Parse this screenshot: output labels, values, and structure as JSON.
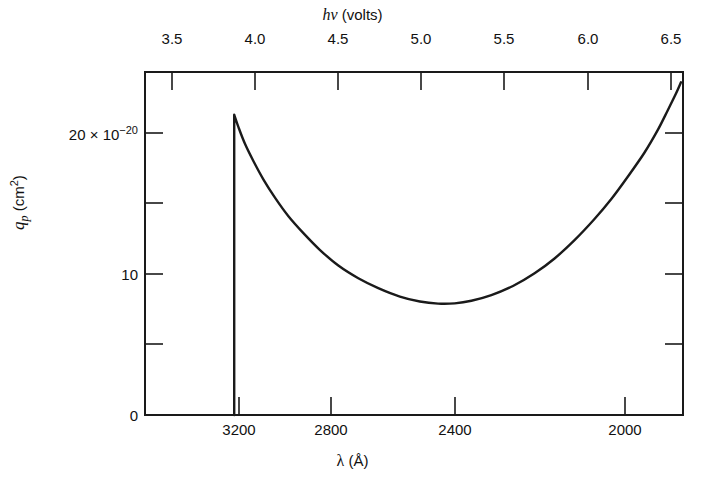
{
  "figure": {
    "background_color": "#ffffff",
    "line_color": "#1a1a1a",
    "axis_color": "#1a1a1a"
  },
  "top_axis": {
    "title_symbol": "hν",
    "title_units": "(volts)",
    "ticks": [
      "3.5",
      "4.0",
      "4.5",
      "5.0",
      "5.5",
      "6.0",
      "6.5"
    ]
  },
  "bottom_axis": {
    "title_symbol": "λ",
    "title_units": "(Å)",
    "ticks": [
      "3200",
      "2800",
      "2400",
      "2000"
    ]
  },
  "y_axis": {
    "title_symbol": "q",
    "title_subscript": "p",
    "title_units": "(cm",
    "title_units_sup": "2",
    "title_units_close": ")",
    "tick_zero": "0",
    "tick_ten": "10",
    "tick_twenty_mantissa": "20 × 10",
    "tick_twenty_exponent": "−20"
  },
  "chart_data": {
    "type": "line",
    "title": "",
    "xlabel": "λ (Å)",
    "ylabel": "q_p (cm^2)",
    "x2label": "hν (volts)",
    "grid": false,
    "legend": "none",
    "x_axis_kind": "photon-energy-linear (wavelength reciprocal)",
    "x2lim": [
      3.34,
      6.62
    ],
    "xlim_wavelength_angstrom": [
      3712,
      1873
    ],
    "ylim": [
      0,
      24.6
    ],
    "y_scale_factor": "1e-20",
    "y_units": "cm^2",
    "y_ticks_major": [
      0,
      10,
      20
    ],
    "y_ticks_minor": [
      5,
      15
    ],
    "x2_ticks": [
      3.5,
      4.0,
      4.5,
      5.0,
      5.5,
      6.0,
      6.5
    ],
    "x_ticks_wavelength": [
      3200,
      2800,
      2400,
      2000
    ],
    "annotations": [
      {
        "text": "absorption threshold: vertical rise at λ ≈ 3200 Å (hν ≈ 3.87 V)"
      },
      {
        "text": "peak q_p ≈ 21.3 × 10^-20 cm^2 at λ ≈ 3195 Å"
      },
      {
        "text": "minimum q_p ≈ 7.9 × 10^-20 cm^2 at λ ≈ 2750 Å"
      },
      {
        "text": "rises again to q_p ≈ 23.6 × 10^-20 cm^2 at λ ≈ 2010 Å"
      }
    ],
    "series": [
      {
        "name": "q_p photodetachment cross section",
        "points_hv_q": [
          [
            3.874,
            0.0
          ],
          [
            3.874,
            21.3
          ],
          [
            3.9,
            20.4
          ],
          [
            3.94,
            19.2
          ],
          [
            3.99,
            18.0
          ],
          [
            4.05,
            16.7
          ],
          [
            4.12,
            15.4
          ],
          [
            4.2,
            14.1
          ],
          [
            4.29,
            12.9
          ],
          [
            4.39,
            11.7
          ],
          [
            4.5,
            10.6
          ],
          [
            4.62,
            9.7
          ],
          [
            4.74,
            9.0
          ],
          [
            4.87,
            8.4
          ],
          [
            4.99,
            8.05
          ],
          [
            5.1,
            7.9
          ],
          [
            5.2,
            7.92
          ],
          [
            5.3,
            8.1
          ],
          [
            5.42,
            8.5
          ],
          [
            5.55,
            9.15
          ],
          [
            5.68,
            10.05
          ],
          [
            5.8,
            11.1
          ],
          [
            5.92,
            12.4
          ],
          [
            6.04,
            13.9
          ],
          [
            6.14,
            15.3
          ],
          [
            6.24,
            16.9
          ],
          [
            6.34,
            18.6
          ],
          [
            6.42,
            20.2
          ],
          [
            6.48,
            21.6
          ],
          [
            6.53,
            22.8
          ],
          [
            6.56,
            23.6
          ]
        ]
      }
    ]
  }
}
